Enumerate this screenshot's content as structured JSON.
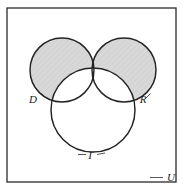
{
  "figure": {
    "type": "venn-diagram",
    "set_count": 3,
    "caption": "",
    "universe": {
      "label": "U",
      "shape": "rectangle",
      "x": 7,
      "y": 8,
      "width": 169,
      "height": 174,
      "border_color": "#2a2a2a",
      "fill": "#ffffff"
    },
    "sets": [
      {
        "id": "D",
        "label": "D",
        "cx": 62,
        "cy": 70,
        "r": 32,
        "label_x": 33,
        "label_y": 103,
        "leader": "M 41.5 93.5 L 46.5 98.5",
        "outline_color": "#232323"
      },
      {
        "id": "R",
        "label": "R",
        "cx": 124,
        "cy": 70,
        "r": 32,
        "label_x": 143,
        "label_y": 103,
        "leader": "M 150.5 93.5 L 145.5 98.5",
        "outline_color": "#232323"
      },
      {
        "id": "I",
        "label": "I",
        "cx": 93,
        "cy": 110,
        "r": 42,
        "label_x": 90,
        "label_y": 159,
        "leader": "M 78 154.5 L 86 154.5 M 97 154.5 L 105 153",
        "outline_color": "#232323"
      }
    ],
    "shading": {
      "description": "symmetric difference of D and R, excluding I",
      "expression": "(D ∪ R) − (D ∩ R) − I",
      "regions_shaded": [
        "D only",
        "R only"
      ],
      "regions_unshaded": [
        "D ∩ R",
        "D ∩ I",
        "R ∩ I",
        "D ∩ R ∩ I",
        "I only",
        "outside all sets"
      ],
      "fill_color": "#d8d8d8",
      "hatch_color": "#cccccc",
      "hatch_style": "diagonal"
    },
    "colors": {
      "background": "#ffffff",
      "stroke": "#232323",
      "shade": "#d8d8d8",
      "text": "#1a1a1a"
    }
  }
}
